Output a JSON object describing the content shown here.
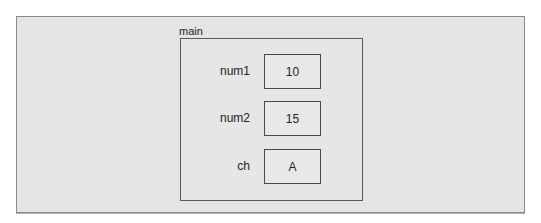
{
  "diagram": {
    "frame": {
      "label": "main"
    },
    "variables": [
      {
        "name": "num1",
        "value": "10"
      },
      {
        "name": "num2",
        "value": "15"
      },
      {
        "name": "ch",
        "value": "A"
      }
    ]
  }
}
